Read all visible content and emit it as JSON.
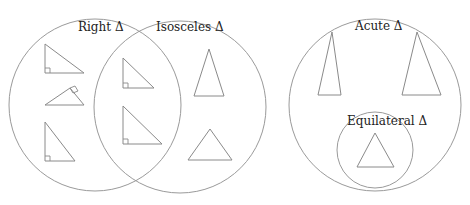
{
  "diagram": {
    "type": "venn",
    "sets": [
      {
        "id": "right",
        "label": "Right Δ",
        "cx": 95,
        "cy": 105,
        "r": 86
      },
      {
        "id": "isosceles",
        "label": "Isosceles Δ",
        "cx": 180,
        "cy": 107,
        "r": 86
      },
      {
        "id": "acute",
        "label": "Acute Δ",
        "cx": 375,
        "cy": 105,
        "r": 86
      },
      {
        "id": "equilateral",
        "label": "Equilateral Δ",
        "cx": 375,
        "cy": 150,
        "r": 38
      }
    ],
    "labels": {
      "right": "Right Δ",
      "isosceles": "Isosceles Δ",
      "acute": "Acute Δ",
      "equilateral": "Equilateral Δ"
    },
    "regions": [
      {
        "set": "right only",
        "shapes": [
          "right triangle (right angle bottom-left)",
          "right triangle (rotated, right angle top)",
          "right triangle (tall, right angle bottom-left)"
        ]
      },
      {
        "set": "right ∩ isosceles",
        "shapes": [
          "isosceles right triangle (small)",
          "isosceles right triangle (large)"
        ]
      },
      {
        "set": "isosceles only",
        "shapes": [
          "tall isosceles triangle",
          "wide isosceles (obtuse) triangle"
        ]
      },
      {
        "set": "acute only",
        "shapes": [
          "narrow acute triangle",
          "tall acute triangle"
        ]
      },
      {
        "set": "equilateral (subset of acute)",
        "shapes": [
          "equilateral triangle"
        ]
      }
    ],
    "stroke_color": "#9a9a9a",
    "text_color": "#222222",
    "background": "#ffffff"
  }
}
